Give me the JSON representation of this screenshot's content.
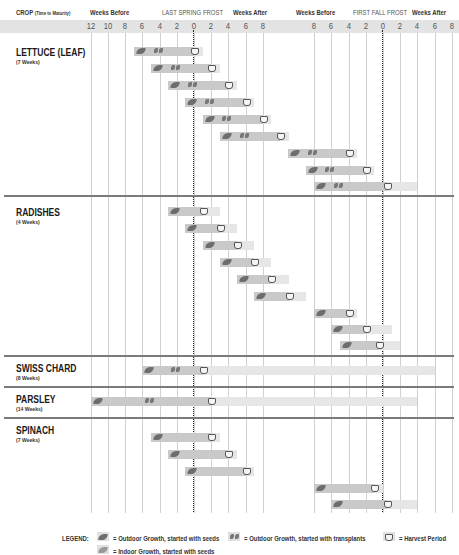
{
  "chart_data": {
    "type": "gantt",
    "title": "",
    "header": {
      "crop_label": "CROP",
      "crop_sub": "(Time to Maturity)",
      "spring_before": "Weeks Before",
      "spring_frost": "LAST SPRING FROST",
      "spring_after": "Weeks After",
      "fall_before": "Weeks Before",
      "fall_frost": "FIRST FALL FROST",
      "fall_after": "Weeks After"
    },
    "spring_ticks": [
      "12",
      "10",
      "8",
      "6",
      "4",
      "2",
      "0",
      "2",
      "4",
      "6",
      "8"
    ],
    "fall_ticks": [
      "8",
      "6",
      "4",
      "2",
      "0",
      "2",
      "4",
      "6",
      "8"
    ],
    "crops": [
      {
        "name": "LETTUCE (LEAF)",
        "maturity": "(7 Weeks)",
        "rows": [
          {
            "start": -7,
            "transplant": -4,
            "harvest": 0,
            "end": 1
          },
          {
            "start": -5,
            "transplant": -2,
            "harvest": 2,
            "end": 3
          },
          {
            "start": -3,
            "transplant": 0,
            "harvest": 4,
            "end": 5
          },
          {
            "start": -1,
            "transplant": 2,
            "harvest": 6,
            "end": 7
          },
          {
            "start": 1,
            "transplant": 4,
            "harvest": 8,
            "end": 9
          },
          {
            "start": 3,
            "transplant": 6,
            "harvest": 10,
            "end": 11
          },
          {
            "start": "F-11",
            "transplant": "F-8",
            "harvest": "F-4",
            "end": "F-3"
          },
          {
            "start": "F-9",
            "transplant": "F-6",
            "harvest": "F-2",
            "end": "F-1"
          },
          {
            "start": "F-8",
            "transplant": "F-5",
            "harvest": "F+0.5",
            "end": "F+4"
          }
        ]
      },
      {
        "name": "RADISHES",
        "maturity": "(4 Weeks)",
        "rows": [
          {
            "start": -3,
            "harvest": 1,
            "end": 3
          },
          {
            "start": -1,
            "harvest": 3,
            "end": 5
          },
          {
            "start": 1,
            "harvest": 5,
            "end": 7
          },
          {
            "start": 3,
            "harvest": 7,
            "end": 9
          },
          {
            "start": 5,
            "harvest": 9,
            "end": 11
          },
          {
            "start": 7,
            "harvest": 11,
            "end": 13
          },
          {
            "start": "F-8",
            "harvest": "F-4",
            "end": "F-3"
          },
          {
            "start": "F-6",
            "harvest": "F-2",
            "end": "F+1"
          },
          {
            "start": "F-5",
            "harvest": "F-0.5",
            "end": "F+2"
          }
        ]
      },
      {
        "name": "SWISS CHARD",
        "maturity": "(8 Weeks)",
        "rows": [
          {
            "start": -6,
            "transplant": -2,
            "harvest": 1,
            "end": "F+6"
          }
        ]
      },
      {
        "name": "PARSLEY",
        "maturity": "(14 Weeks)",
        "rows": [
          {
            "start": -12,
            "transplant": -5,
            "harvest": 2,
            "end": "F+4"
          }
        ]
      },
      {
        "name": "SPINACH",
        "maturity": "(7 Weeks)",
        "rows": [
          {
            "start": -5,
            "harvest": 2,
            "end": 3
          },
          {
            "start": -3,
            "harvest": 4,
            "end": 5
          },
          {
            "start": -1,
            "harvest": 6,
            "end": 7
          },
          {
            "start": "F-8",
            "harvest": "F-1",
            "end": "F"
          },
          {
            "start": "F-6",
            "harvest": "F+0.5",
            "end": "F+4"
          }
        ]
      }
    ],
    "legend": {
      "title": "LEGEND:",
      "items": [
        {
          "icon": "outdoor-seed-icon",
          "label": "= Outdoor Growth, started with seeds"
        },
        {
          "icon": "transplant-icon",
          "label": "= Outdoor Growth, started with transplants"
        },
        {
          "icon": "harvest-basket-icon",
          "label": "= Harvest Period"
        },
        {
          "icon": "indoor-seed-icon",
          "label": "= Indoor Growth, started with seeds"
        }
      ]
    },
    "colors": {
      "growth": "#c9c9c9",
      "harvest": "#e6e6e6",
      "separator": "#7a7a7a",
      "band": "#e3e3e3"
    }
  }
}
